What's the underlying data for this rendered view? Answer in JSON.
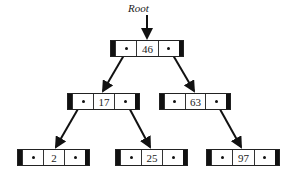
{
  "diagram": {
    "type": "binary-search-tree",
    "root_label": "Root",
    "nodes": [
      {
        "id": "n46",
        "value": "46",
        "left": "n17",
        "right": "n63"
      },
      {
        "id": "n17",
        "value": "17",
        "left": "n2",
        "right": "n25"
      },
      {
        "id": "n63",
        "value": "63",
        "left": null,
        "right": "n97"
      },
      {
        "id": "n2",
        "value": "2",
        "left": null,
        "right": null
      },
      {
        "id": "n25",
        "value": "25",
        "left": null,
        "right": null
      },
      {
        "id": "n97",
        "value": "97",
        "left": null,
        "right": null
      }
    ],
    "edges": [
      {
        "from": "n46",
        "to": "n17"
      },
      {
        "from": "n46",
        "to": "n63"
      },
      {
        "from": "n17",
        "to": "n2"
      },
      {
        "from": "n17",
        "to": "n25"
      },
      {
        "from": "n63",
        "to": "n97"
      }
    ]
  }
}
